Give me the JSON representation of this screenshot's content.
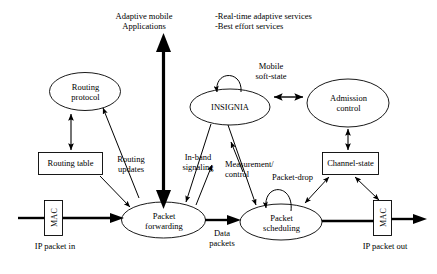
{
  "figure": {
    "title_top_left": "Adaptive mobile\nApplications",
    "services_list": "-Real-time adaptive services\n-Best effort services"
  },
  "nodes": {
    "routing_protocol": {
      "label": "Routing\nprotocol",
      "shape": "ellipse"
    },
    "insignia": {
      "label": "INSIGNIA",
      "shape": "ellipse"
    },
    "admission_control": {
      "label": "Admission\ncontrol",
      "shape": "ellipse"
    },
    "routing_table": {
      "label": "Routing table",
      "shape": "rect"
    },
    "channel_state": {
      "label": "Channel-state",
      "shape": "rect"
    },
    "packet_forwarding": {
      "label": "Packet\nforwarding",
      "shape": "ellipse"
    },
    "packet_scheduling": {
      "label": "Packet\nscheduling",
      "shape": "ellipse"
    },
    "mac_left": {
      "label": "MAC",
      "shape": "rect"
    },
    "mac_right": {
      "label": "MAC",
      "shape": "rect"
    }
  },
  "edge_labels": {
    "mobile_soft_state": "Mobile\nsoft-state",
    "routing_updates": "Routing\nupdates",
    "in_band_signaling": "In-band\nsignaling",
    "measurement_control": "Measurement/\ncontrol",
    "packet_drop": "Packet-drop",
    "data_packets": "Data\npackets"
  },
  "io_labels": {
    "ip_packet_in": "IP packet in",
    "ip_packet_out": "IP packet out"
  },
  "colors": {
    "stroke": "#000000",
    "background": "#ffffff",
    "text": "#000000"
  }
}
